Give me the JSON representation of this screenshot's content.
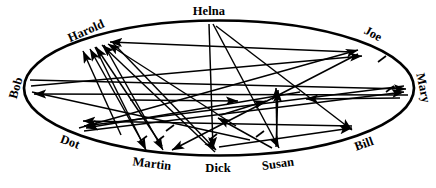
{
  "diagram": {
    "type": "sociogram",
    "shape": "ellipse",
    "background_color": "#ffffff",
    "stroke_color": "#000000",
    "ellipse": {
      "cx": 219,
      "cy": 88,
      "rx": 196,
      "ry": 68,
      "stroke_width": 2.6
    },
    "nodes": [
      {
        "id": "bob",
        "label": "Bob",
        "x": 16,
        "y": 88,
        "rotation": -74,
        "anchor_x": 25,
        "anchor_y": 88
      },
      {
        "id": "harold",
        "label": "Harold",
        "x": 86,
        "y": 31,
        "rotation": -24,
        "anchor_x": 96,
        "anchor_y": 42
      },
      {
        "id": "helna",
        "label": "Helna",
        "x": 209,
        "y": 12,
        "rotation": 0,
        "anchor_x": 209,
        "anchor_y": 21
      },
      {
        "id": "joe",
        "label": "Joe",
        "x": 372,
        "y": 35,
        "rotation": 28,
        "anchor_x": 366,
        "anchor_y": 46
      },
      {
        "id": "mary",
        "label": "Mary",
        "x": 422,
        "y": 88,
        "rotation": 78,
        "anchor_x": 414,
        "anchor_y": 88
      },
      {
        "id": "bill",
        "label": "Bill",
        "x": 363,
        "y": 143,
        "rotation": -20,
        "anchor_x": 356,
        "anchor_y": 134
      },
      {
        "id": "susan",
        "label": "Susan",
        "x": 277,
        "y": 163,
        "rotation": -8,
        "anchor_x": 277,
        "anchor_y": 153
      },
      {
        "id": "dick",
        "label": "Dick",
        "x": 218,
        "y": 167,
        "rotation": 0,
        "anchor_x": 218,
        "anchor_y": 156
      },
      {
        "id": "martin",
        "label": "Martin",
        "x": 152,
        "y": 163,
        "rotation": 7,
        "anchor_x": 152,
        "anchor_y": 153
      },
      {
        "id": "dot",
        "label": "Dot",
        "x": 70,
        "y": 141,
        "rotation": 20,
        "anchor_x": 77,
        "anchor_y": 133
      }
    ],
    "edges": [
      {
        "from": "dick",
        "to": "harold",
        "tick": false
      },
      {
        "from": "martin",
        "to": "harold",
        "tick": false
      },
      {
        "from": "susan",
        "to": "harold",
        "tick": false
      },
      {
        "from": "bill",
        "to": "harold",
        "tick": false
      },
      {
        "from": "joe",
        "to": "harold",
        "tick": false
      },
      {
        "from": "helna",
        "to": "dick",
        "tick": false
      },
      {
        "from": "helna",
        "to": "susan",
        "tick": false
      },
      {
        "from": "helna",
        "to": "bill",
        "tick": false
      },
      {
        "from": "harold",
        "to": "martin",
        "tick": true
      },
      {
        "from": "harold",
        "to": "dick",
        "tick": true
      },
      {
        "from": "harold",
        "to": "martin2",
        "tick": true
      },
      {
        "from": "bob",
        "to": "mary",
        "tick": true
      },
      {
        "from": "bob",
        "to": "joe",
        "tick": true
      },
      {
        "from": "mary",
        "to": "bob",
        "tick": false
      },
      {
        "from": "dot",
        "to": "joe",
        "tick": false
      },
      {
        "from": "dot",
        "to": "mary",
        "tick": false
      },
      {
        "from": "mary",
        "to": "dot",
        "tick": false
      },
      {
        "from": "susan",
        "to": "dick",
        "tick": true
      },
      {
        "from": "susan",
        "to": "mary",
        "tick": false
      },
      {
        "from": "dick",
        "to": "bill",
        "tick": false
      },
      {
        "from": "bill",
        "to": "martin",
        "tick": false
      },
      {
        "from": "joe",
        "to": "martin",
        "tick": false
      }
    ],
    "edge_count": 22,
    "node_count": 10
  }
}
